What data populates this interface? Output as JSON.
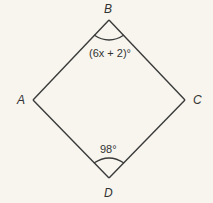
{
  "figure": {
    "shape": "quadrilateral ABCD (rhombus)",
    "vertices": {
      "A": "A",
      "B": "B",
      "C": "C",
      "D": "D"
    },
    "angles": {
      "B": "(6x + 2)°",
      "D": "98°"
    }
  }
}
